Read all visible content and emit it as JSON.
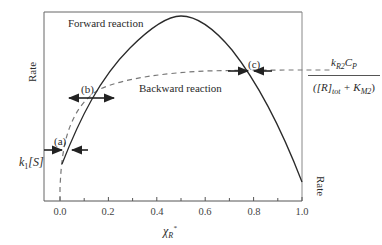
{
  "diagram": {
    "title": "",
    "y_axis_left_label": "Rate",
    "y_axis_right_label": "Rate",
    "x_axis_label_symbol": "χ",
    "x_axis_label_sub": "R",
    "x_axis_label_sup": "*",
    "x_ticks": [
      "0.0",
      "0.2",
      "0.4",
      "0.6",
      "0.8",
      "1.0"
    ],
    "curves": [
      {
        "name": "Forward reaction",
        "style": "solid",
        "shape": "inverted parabola, peak near x=0.5"
      },
      {
        "name": "Backward reaction",
        "style": "dashed",
        "shape": "saturating curve rising from origin"
      }
    ],
    "labels": {
      "forward": "Forward reaction",
      "backward": "Backward reaction",
      "point_a": "(a)",
      "point_b": "(b)",
      "point_c": "(c)",
      "k1S_k": "k",
      "k1S_sub": "1",
      "k1S_rest": "[S]",
      "frac_num_k": "k",
      "frac_num_ksub": "R2",
      "frac_num_c": "C",
      "frac_num_csub": "P",
      "frac_den_open": "([R]",
      "frac_den_sub": "tot",
      "frac_den_plus": " + K",
      "frac_den_ksub": "M2",
      "frac_den_close": ")"
    },
    "intersections": [
      {
        "label": "(a)",
        "x": 0.02,
        "arrows": "converging"
      },
      {
        "label": "(b)",
        "x": 0.13,
        "arrows": "diverging"
      },
      {
        "label": "(c)",
        "x": 0.78,
        "arrows": "converging"
      }
    ]
  }
}
